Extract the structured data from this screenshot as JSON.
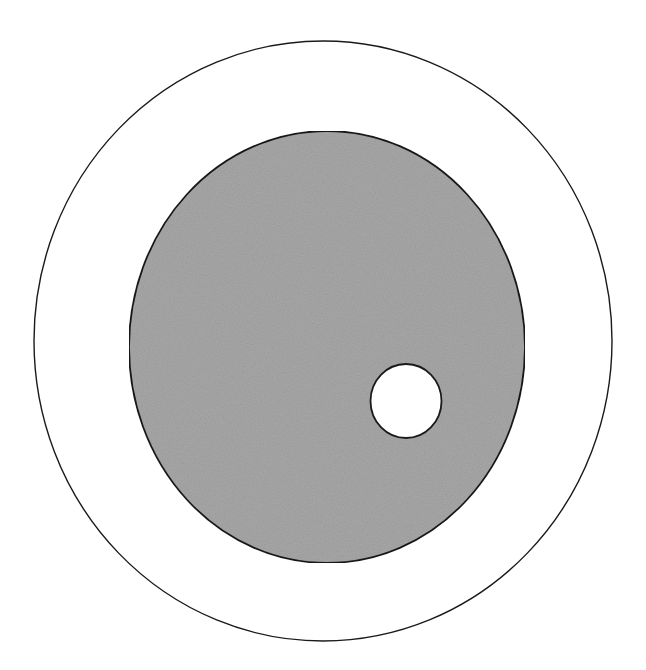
{
  "diagram": {
    "type": "nested-circles",
    "background": "#ffffff",
    "stroke_color": "#1a1a1a",
    "shapes": [
      {
        "id": "outer-circle",
        "kind": "ellipse",
        "cx": 323,
        "cy": 341,
        "rx": 289,
        "ry": 300,
        "fill": "#ffffff",
        "stroke_width": 1.4
      },
      {
        "id": "inner-gray-region",
        "kind": "ellipse",
        "cx": 327,
        "cy": 347,
        "rx": 198,
        "ry": 216,
        "fill": "#a8a8a8",
        "textured": true,
        "stroke_width": 1.8
      },
      {
        "id": "small-white-hole",
        "kind": "ellipse",
        "cx": 406,
        "cy": 401,
        "rx": 35.5,
        "ry": 37,
        "fill": "#ffffff",
        "stroke_width": 1.8
      }
    ]
  }
}
